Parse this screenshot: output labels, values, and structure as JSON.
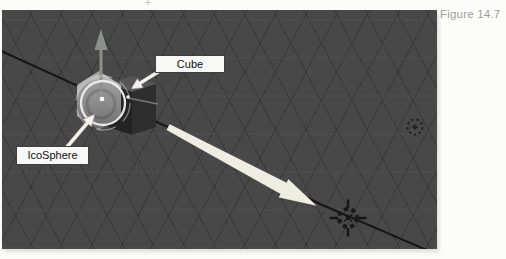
{
  "figure": {
    "caption": "Figure 14.7"
  },
  "viewport": {
    "labels": {
      "cube": "Cube",
      "icosphere": "IcoSphere"
    },
    "objects": [
      "Cube",
      "IcoSphere"
    ],
    "icons": {
      "cursor": "3d-cursor-icon",
      "empty": "empty-object-icon",
      "gizmo_arrow": "translate-z-arrow-icon",
      "gizmo_ring": "rotate-gizmo-ring-icon"
    }
  },
  "colors": {
    "viewport_bg": "#484848",
    "grid_line": "rgba(0,0,0,0.20)",
    "axis_line": "#161616",
    "annotation_arrow": "#efede2",
    "label_bg": "#f8f8f6",
    "label_border": "#3f3f3f",
    "caption_text": "#9c9c9c"
  }
}
